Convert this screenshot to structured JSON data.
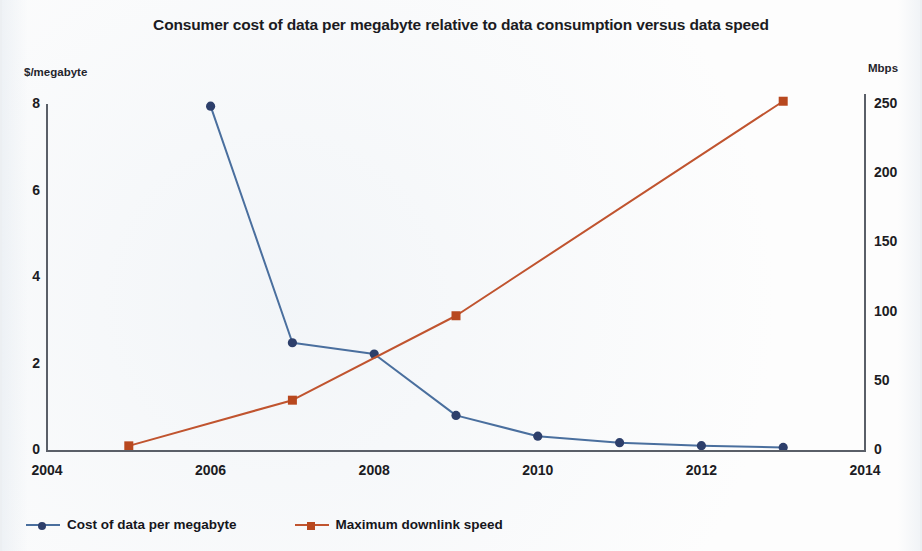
{
  "chart_data": {
    "type": "line",
    "title": "Consumer cost of data per megabyte relative to data consumption versus data speed",
    "xlabel": "",
    "ylabel": "$/megabyte",
    "y2label": "Mbps",
    "xlim": [
      2004,
      2014
    ],
    "ylim": [
      0,
      8
    ],
    "y2lim": [
      0,
      250
    ],
    "xticks": [
      "2004",
      "2006",
      "2008",
      "2010",
      "2012",
      "2014"
    ],
    "yticks": [
      "0",
      "2",
      "4",
      "6",
      "8"
    ],
    "y2ticks": [
      "0",
      "50",
      "100",
      "150",
      "200",
      "250"
    ],
    "grid": false,
    "legend_position": "bottom-left",
    "series": [
      {
        "name": "Cost of data per megabyte",
        "axis": "left",
        "color": "#4a6f9e",
        "marker_color": "#2d3f6b",
        "marker": "circle",
        "x": [
          2006,
          2007,
          2008,
          2009,
          2010,
          2011,
          2012,
          2013
        ],
        "values": [
          7.95,
          2.48,
          2.22,
          0.8,
          0.32,
          0.17,
          0.1,
          0.06
        ]
      },
      {
        "name": "Maximum downlink speed",
        "axis": "right",
        "color": "#c0542f",
        "marker_color": "#b8481f",
        "marker": "square",
        "x": [
          2005,
          2007,
          2009,
          2013
        ],
        "values": [
          3,
          36,
          97,
          252
        ]
      }
    ]
  },
  "axes": {
    "left_unit": "$/megabyte",
    "right_unit": "Mbps"
  },
  "legend": {
    "items": [
      {
        "label": "Cost of data per megabyte",
        "color": "#4a6f9e",
        "marker_color": "#2d3f6b",
        "marker": "circle"
      },
      {
        "label": "Maximum downlink speed",
        "color": "#c0542f",
        "marker_color": "#b8481f",
        "marker": "square"
      }
    ]
  }
}
